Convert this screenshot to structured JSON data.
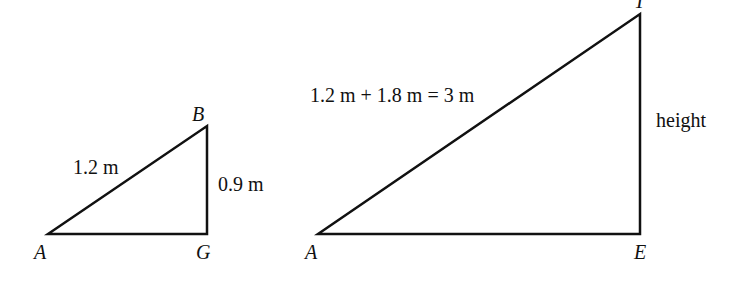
{
  "diagram": {
    "type": "similar right triangles",
    "small_triangle": {
      "vertices": {
        "A": "A",
        "B": "B",
        "G": "G"
      },
      "hypotenuse_label": "1.2 m",
      "vertical_label": "0.9 m"
    },
    "large_triangle": {
      "vertices": {
        "A": "A",
        "T": "T",
        "E": "E"
      },
      "hypotenuse_label": "1.2 m + 1.8 m = 3 m",
      "vertical_label": "height"
    },
    "colors": {
      "line": "#111111",
      "background": "#ffffff"
    }
  }
}
